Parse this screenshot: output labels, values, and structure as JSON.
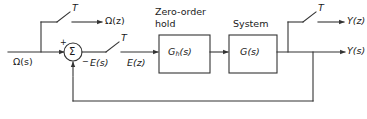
{
  "diagram": {
    "stroke_color": "#333333",
    "text_color": "#1a1a1a",
    "background": "#ffffff",
    "signals": {
      "input_s": "Ω(s)",
      "sampled_input_z": "Ω(z)",
      "error_s": "E(s)",
      "error_z": "E(z)",
      "output_z": "Y(z)",
      "output_s": "Y(s)"
    },
    "samplers": [
      {
        "id": "sampler-input",
        "label": "T"
      },
      {
        "id": "sampler-error",
        "label": "T"
      },
      {
        "id": "sampler-output",
        "label": "T"
      }
    ],
    "summing_junction": {
      "symbol": "Σ",
      "plus_sign": "+",
      "minus_sign": "−"
    },
    "blocks": [
      {
        "id": "zero-order-hold",
        "caption_line1": "Zero-order",
        "caption_line2": "hold",
        "transfer_function_base": "G",
        "transfer_function_sub": "h",
        "transfer_function_arg": "(s)"
      },
      {
        "id": "system",
        "caption_line1": "System",
        "caption_line2": "",
        "transfer_function_base": "G",
        "transfer_function_sub": "",
        "transfer_function_arg": "(s)"
      }
    ]
  }
}
